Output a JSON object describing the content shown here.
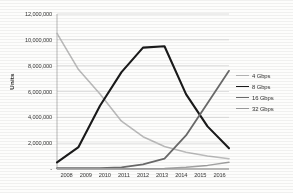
{
  "chart_data": {
    "type": "line",
    "title": "",
    "xlabel": "",
    "ylabel": "Units",
    "categories": [
      2008,
      2009,
      2010,
      2011,
      2012,
      2013,
      2014,
      2015,
      2016
    ],
    "x_tick_labels": [
      "2008",
      "2009",
      "2010",
      "2011",
      "2012",
      "2013",
      "2014",
      "2015",
      "2016"
    ],
    "y_tick_labels": [
      "12,000,000",
      "10,000,000",
      "8,000,000",
      "6,000,000",
      "4,000,000",
      "2,000,000",
      "-"
    ],
    "y_tick_values": [
      12000000,
      10000000,
      8000000,
      6000000,
      4000000,
      2000000,
      0
    ],
    "ylim": [
      0,
      12000000
    ],
    "grid": "horizontal",
    "legend_position": "right",
    "series": [
      {
        "name": "4 Gbps",
        "color": "#b9b9b9",
        "width": 1.6,
        "values": [
          10500000,
          7700000,
          5800000,
          3700000,
          2500000,
          1750000,
          1300000,
          1000000,
          800000
        ]
      },
      {
        "name": "8 Gbps",
        "color": "#1d1d1d",
        "width": 2.1,
        "values": [
          520000,
          1700000,
          4900000,
          7500000,
          9400000,
          9500000,
          5800000,
          3300000,
          1600000
        ]
      },
      {
        "name": "16 Gbps",
        "color": "#6b6b6b",
        "width": 1.8,
        "values": [
          60000,
          60000,
          60000,
          120000,
          350000,
          800000,
          2600000,
          5100000,
          7600000
        ]
      },
      {
        "name": "32 Gbps",
        "color": "#a0a0a0",
        "width": 1.5,
        "values": [
          20000,
          20000,
          20000,
          20000,
          20000,
          40000,
          130000,
          280000,
          520000
        ]
      }
    ]
  },
  "legend": {
    "items": [
      {
        "label": "4 Gbps"
      },
      {
        "label": "8 Gbps"
      },
      {
        "label": "16 Gbps"
      },
      {
        "label": "32 Gbps"
      }
    ]
  }
}
